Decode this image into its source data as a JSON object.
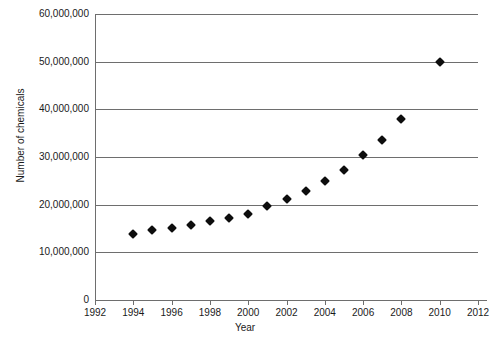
{
  "chart_data": {
    "type": "scatter",
    "title": "",
    "xlabel": "Year",
    "ylabel": "Number of chemicals",
    "xlim": [
      1992,
      2012
    ],
    "ylim": [
      0,
      60000000
    ],
    "grid": true,
    "legend": false,
    "x_ticks": [
      1992,
      1994,
      1996,
      1998,
      2000,
      2002,
      2004,
      2006,
      2008,
      2010,
      2012
    ],
    "x_tick_labels": [
      "1992",
      "1994",
      "1996",
      "1998",
      "2000",
      "2002",
      "2004",
      "2006",
      "2008",
      "2010",
      "2012"
    ],
    "y_ticks": [
      0,
      10000000,
      20000000,
      30000000,
      40000000,
      50000000,
      60000000
    ],
    "y_tick_labels": [
      "0",
      "10,000,000",
      "20,000,000",
      "30,000,000",
      "40,000,000",
      "50,000,000",
      "60,000,000"
    ],
    "marker": "diamond",
    "marker_color": "#0d0d0d",
    "grid_color": "#6e6e6e",
    "x": [
      1994,
      1995,
      1996,
      1997,
      1998,
      1999,
      2000,
      2001,
      2002,
      2003,
      2004,
      2005,
      2006,
      2007,
      2008,
      2010
    ],
    "y": [
      13800000,
      14600000,
      15200000,
      15800000,
      16500000,
      17200000,
      18000000,
      19800000,
      21200000,
      22800000,
      25000000,
      27200000,
      30500000,
      33500000,
      38000000,
      50000000
    ],
    "series": [
      {
        "name": "Number of chemicals",
        "points": [
          {
            "x": 1994,
            "y": 13800000
          },
          {
            "x": 1995,
            "y": 14600000
          },
          {
            "x": 1996,
            "y": 15200000
          },
          {
            "x": 1997,
            "y": 15800000
          },
          {
            "x": 1998,
            "y": 16500000
          },
          {
            "x": 1999,
            "y": 17200000
          },
          {
            "x": 2000,
            "y": 18000000
          },
          {
            "x": 2001,
            "y": 19800000
          },
          {
            "x": 2002,
            "y": 21200000
          },
          {
            "x": 2003,
            "y": 22800000
          },
          {
            "x": 2004,
            "y": 25000000
          },
          {
            "x": 2005,
            "y": 27200000
          },
          {
            "x": 2006,
            "y": 30500000
          },
          {
            "x": 2007,
            "y": 33500000
          },
          {
            "x": 2008,
            "y": 38000000
          },
          {
            "x": 2010,
            "y": 50000000
          }
        ]
      }
    ]
  }
}
